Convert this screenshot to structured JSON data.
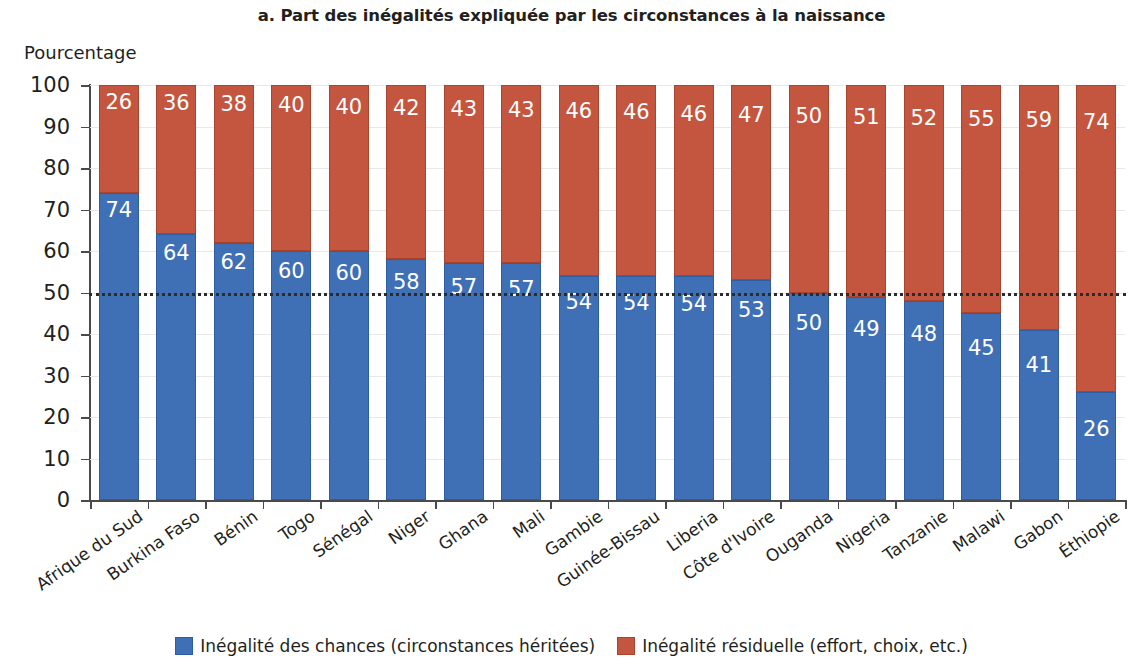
{
  "chart_data": {
    "type": "bar",
    "stacked": true,
    "title": "a. Part des inégalités expliquée par les circonstances à la naissance",
    "ylabel": "Pourcentage",
    "xlabel": "",
    "ylim": [
      0,
      100
    ],
    "yticks": [
      0,
      10,
      20,
      30,
      40,
      50,
      60,
      70,
      80,
      90,
      100
    ],
    "grid": true,
    "legend_position": "bottom",
    "reference_line": 50,
    "categories": [
      "Afrique du Sud",
      "Burkina Faso",
      "Bénin",
      "Togo",
      "Sénégal",
      "Niger",
      "Ghana",
      "Mali",
      "Gambie",
      "Guinée-Bissau",
      "Liberia",
      "Côte d'Ivoire",
      "Ouganda",
      "Nigeria",
      "Tanzanie",
      "Malawi",
      "Gabon",
      "Éthiopie"
    ],
    "series": [
      {
        "name": "Inégalité des chances (circonstances héritées)",
        "color": "#3f6fb5",
        "values": [
          74,
          64,
          62,
          60,
          60,
          58,
          57,
          57,
          54,
          54,
          54,
          53,
          50,
          49,
          48,
          45,
          41,
          26
        ]
      },
      {
        "name": "Inégalité résiduelle (effort, choix, etc.)",
        "color": "#c4563f",
        "values": [
          26,
          36,
          38,
          40,
          40,
          42,
          43,
          43,
          46,
          46,
          46,
          47,
          50,
          51,
          52,
          55,
          59,
          74
        ]
      }
    ]
  },
  "legend": {
    "items": [
      {
        "label": "Inégalité des chances (circonstances héritées)",
        "swatch": "blue"
      },
      {
        "label": "Inégalité résiduelle (effort, choix, etc.)",
        "swatch": "red"
      }
    ]
  }
}
